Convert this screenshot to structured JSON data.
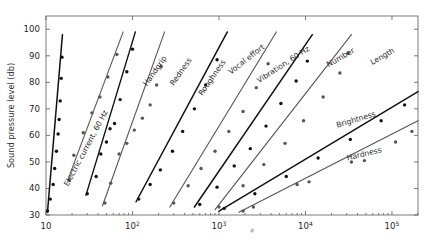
{
  "chart_data": {
    "type": "line",
    "title": "",
    "xlabel": "φ",
    "ylabel": "Sound pressure level (db)",
    "xscale": "log",
    "xlim": [
      10,
      200000
    ],
    "ylim": [
      30,
      105
    ],
    "grid": false,
    "legend_position": "inline-labels",
    "x_ticks": [
      {
        "value": 10,
        "label": "10",
        "exp": ""
      },
      {
        "value": 100,
        "label": "10",
        "exp": "2"
      },
      {
        "value": 1000,
        "label": "10",
        "exp": "3"
      },
      {
        "value": 10000,
        "label": "10",
        "exp": "4"
      },
      {
        "value": 100000,
        "label": "10",
        "exp": "5"
      }
    ],
    "y_ticks": [
      30,
      40,
      50,
      60,
      70,
      80,
      90,
      100
    ],
    "series": [
      {
        "name": "Electric current, 60 Hz",
        "label": "Electric current, 60 Hz",
        "color": "#111111",
        "width": 1.5,
        "fit": [
          [
            10.4,
            31.0
          ],
          [
            15.5,
            98.0
          ]
        ],
        "points": [
          [
            10.4,
            31.5
          ],
          [
            11.2,
            36.0
          ],
          [
            12.1,
            41.5
          ],
          [
            12.6,
            47.5
          ],
          [
            13.2,
            54.0
          ],
          [
            13.8,
            60.5
          ],
          [
            14.2,
            66.0
          ],
          [
            14.6,
            73.0
          ],
          [
            15.0,
            81.5
          ],
          [
            15.3,
            89.5
          ]
        ]
      },
      {
        "name": "Handgrip",
        "label": "Handgrip",
        "color": "#555555",
        "width": 1.1,
        "fit": [
          [
            18.0,
            43.5
          ],
          [
            78.0,
            99.0
          ]
        ],
        "points": [
          [
            18.5,
            43.0
          ],
          [
            21.0,
            52.5
          ],
          [
            27.0,
            61.0
          ],
          [
            34.0,
            68.5
          ],
          [
            42.0,
            74.5
          ],
          [
            52.0,
            82.0
          ],
          [
            66.0,
            90.5
          ]
        ]
      },
      {
        "name": "Redness",
        "label": "Redness",
        "color": "#111111",
        "width": 1.4,
        "fit": [
          [
            29.0,
            37.5
          ],
          [
            108.0,
            99.0
          ]
        ],
        "points": [
          [
            30.0,
            38.0
          ],
          [
            38.0,
            44.5
          ],
          [
            43.0,
            53.0
          ],
          [
            50.0,
            57.5
          ],
          [
            55.0,
            62.5
          ],
          [
            62.0,
            64.5
          ],
          [
            72.0,
            73.5
          ],
          [
            86.0,
            84.0
          ],
          [
            100.0,
            92.5
          ]
        ]
      },
      {
        "name": "Roughness",
        "label": "Roughness",
        "color": "#555555",
        "width": 1.1,
        "fit": [
          [
            45.0,
            33.5
          ],
          [
            235.0,
            99.0
          ]
        ],
        "points": [
          [
            48.0,
            34.5
          ],
          [
            56.0,
            42.0
          ],
          [
            70.0,
            53.0
          ],
          [
            86.0,
            57.0
          ],
          [
            105.0,
            62.0
          ],
          [
            130.0,
            66.5
          ],
          [
            160.0,
            71.5
          ],
          [
            190.0,
            79.0
          ],
          [
            215.0,
            86.0
          ]
        ]
      },
      {
        "name": "Vocal effort",
        "label": "Vocal effort",
        "color": "#111111",
        "width": 1.5,
        "fit": [
          [
            110.0,
            35.0
          ],
          [
            1250.0,
            99.0
          ]
        ],
        "points": [
          [
            118.0,
            36.0
          ],
          [
            160.0,
            41.5
          ],
          [
            210.0,
            47.0
          ],
          [
            290.0,
            54.0
          ],
          [
            380.0,
            61.5
          ],
          [
            520.0,
            70.0
          ],
          [
            700.0,
            79.0
          ],
          [
            950.0,
            88.5
          ]
        ]
      },
      {
        "name": "Vibration, 60 Hz",
        "label": "Vibration, 60 Hz",
        "color": "#555555",
        "width": 1.1,
        "fit": [
          [
            270.0,
            33.0
          ],
          [
            4600.0,
            99.0
          ]
        ],
        "points": [
          [
            300.0,
            34.5
          ],
          [
            440.0,
            41.0
          ],
          [
            620.0,
            47.5
          ],
          [
            900.0,
            54.0
          ],
          [
            1300.0,
            61.5
          ],
          [
            1900.0,
            69.0
          ],
          [
            2700.0,
            78.0
          ],
          [
            3700.0,
            87.0
          ]
        ]
      },
      {
        "name": "Number",
        "label": "Number",
        "color": "#111111",
        "width": 1.5,
        "fit": [
          [
            520.0,
            33.0
          ],
          [
            12000.0,
            98.0
          ]
        ],
        "points": [
          [
            600.0,
            34.0
          ],
          [
            950.0,
            40.5
          ],
          [
            1500.0,
            48.5
          ],
          [
            2300.0,
            55.0
          ],
          [
            3500.0,
            63.5
          ],
          [
            5200.0,
            72.0
          ],
          [
            7800.0,
            80.5
          ],
          [
            10500.0,
            88.0
          ]
        ]
      },
      {
        "name": "Length",
        "label": "Length",
        "color": "#555555",
        "width": 1.1,
        "fit": [
          [
            900.0,
            32.0
          ],
          [
            34000.0,
            98.0
          ]
        ],
        "points": [
          [
            1000.0,
            33.0
          ],
          [
            1900.0,
            41.0
          ],
          [
            3300.0,
            49.0
          ],
          [
            5800.0,
            57.0
          ],
          [
            9500.0,
            65.5
          ],
          [
            16000.0,
            74.5
          ],
          [
            25000.0,
            83.5
          ],
          [
            31000.0,
            91.0
          ]
        ]
      },
      {
        "name": "Brightness",
        "label": "Brightness",
        "color": "#111111",
        "width": 1.5,
        "fit": [
          [
            1000.0,
            31.5
          ],
          [
            200000.0,
            76.5
          ]
        ],
        "points": [
          [
            1150.0,
            32.5
          ],
          [
            2600.0,
            38.0
          ],
          [
            6000.0,
            44.5
          ],
          [
            14000.0,
            51.5
          ],
          [
            33000.0,
            58.5
          ],
          [
            75000.0,
            65.5
          ],
          [
            140000.0,
            71.5
          ]
        ]
      },
      {
        "name": "Hardness",
        "label": "Hardness",
        "color": "#555555",
        "width": 1.1,
        "fit": [
          [
            1700.0,
            31.0
          ],
          [
            200000.0,
            65.5
          ]
        ],
        "points": [
          [
            1900.0,
            31.5
          ],
          [
            2500.0,
            33.0
          ],
          [
            8000.0,
            41.5
          ],
          [
            11000.0,
            42.5
          ],
          [
            34000.0,
            50.0
          ],
          [
            48000.0,
            50.5
          ],
          [
            110000.0,
            57.5
          ],
          [
            170000.0,
            61.5
          ]
        ]
      }
    ],
    "curve_labels": [
      {
        "text": "Electric current, 60 Hz",
        "x": 108,
        "y": 112,
        "rotate": -62
      },
      {
        "text": "Handgrip",
        "x": 167,
        "y": 58,
        "rotate": -55
      },
      {
        "text": "Redness",
        "x": 192,
        "y": 60,
        "rotate": -55
      },
      {
        "text": "Roughness",
        "x": 226,
        "y": 62,
        "rotate": -55
      },
      {
        "text": "Vocal effort",
        "x": 265,
        "y": 48,
        "rotate": -38
      },
      {
        "text": "Vibration, 60 Hz",
        "x": 310,
        "y": 50,
        "rotate": -33
      },
      {
        "text": "Number",
        "x": 355,
        "y": 52,
        "rotate": -30
      },
      {
        "text": "Length",
        "x": 395,
        "y": 52,
        "rotate": -30
      },
      {
        "text": "Brightness",
        "x": 376,
        "y": 116,
        "rotate": -17
      },
      {
        "text": "Hardness",
        "x": 382,
        "y": 152,
        "rotate": -14
      }
    ]
  }
}
